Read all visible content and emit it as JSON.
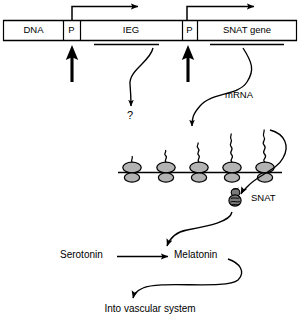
{
  "figure": {
    "stroke_color": "#000000",
    "background_color": "#ffffff",
    "ribosome_fill": "#b3b3b3",
    "protein_fill": "#7a7a7a"
  },
  "dna": {
    "label": "DNA",
    "segments": [
      {
        "name": "dna",
        "label": "DNA",
        "x": 4,
        "width": 59
      },
      {
        "name": "promoter-1",
        "label": "P",
        "x": 63,
        "width": 17
      },
      {
        "name": "immediate-early-gene",
        "label": "IEG",
        "x": 80,
        "width": 102
      },
      {
        "name": "promoter-2",
        "label": "P",
        "x": 182,
        "width": 15
      },
      {
        "name": "snat-gene",
        "label": "SNAT gene",
        "x": 197,
        "width": 100
      }
    ]
  },
  "labels": {
    "question_mark": "?",
    "mrna": "mRNA",
    "snat_protein": "SNAT",
    "serotonin": "Serotonin",
    "melatonin": "Melatonin",
    "vascular": "Into vascular system"
  },
  "polysome": {
    "ribosome_count": 5,
    "ribosome_x": [
      132,
      166,
      199,
      232,
      265
    ],
    "chain_lengths": [
      6,
      13,
      20,
      27,
      34
    ]
  },
  "arrows": {
    "transcription_start_1": "bent-arrow-right",
    "transcription_start_2": "bent-arrow-right",
    "signal_1": "thick-arrow-up",
    "signal_2": "thick-arrow-up",
    "ieg_to_unknown": "curved-arrow-down",
    "snat_to_mrna": "curved-arrow-down",
    "mrna_to_protein": "curved-arrow-down",
    "serotonin_to_melatonin": "straight-arrow-right",
    "snat_to_reaction": "curved-arrow-down",
    "melatonin_to_vascular": "curved-arrow-down"
  }
}
